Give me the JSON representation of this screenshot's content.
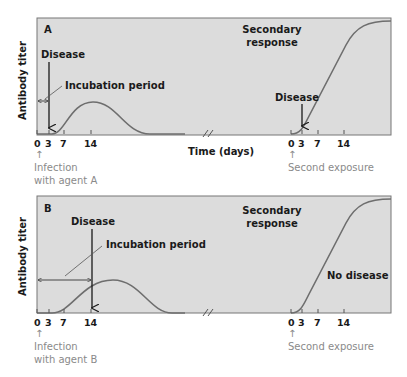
{
  "colors": {
    "panel_fill": "#dcdcdc",
    "panel_border": "#777777",
    "curve": "#6e6e6e",
    "text": "#1a1a1a",
    "grey_text": "#8a8a8a"
  },
  "shared": {
    "y_axis_label": "Antibody titer",
    "x_axis_label": "Time (days)",
    "primary_ticks": [
      "0",
      "3",
      "7",
      "14"
    ],
    "secondary_ticks": [
      "0",
      "3",
      "7",
      "14"
    ],
    "second_exposure_label": "Second exposure",
    "secondary_response_line1": "Secondary",
    "secondary_response_line2": "response",
    "up_arrow": "↑"
  },
  "panel_a": {
    "letter": "A",
    "disease_label": "Disease",
    "incubation_label": "Incubation period",
    "secondary_disease_label": "Disease",
    "infection_line1": "Infection",
    "infection_line2": "with agent A"
  },
  "panel_b": {
    "letter": "B",
    "disease_label": "Disease",
    "incubation_label": "Incubation period",
    "no_disease_label": "No disease",
    "infection_line1": "Infection",
    "infection_line2": "with agent B"
  }
}
